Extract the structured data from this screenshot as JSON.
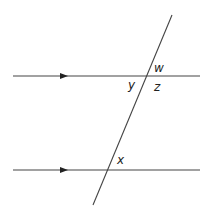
{
  "diagram": {
    "stroke_color": "#444444",
    "lines": {
      "top_parallel": {
        "x1": 13,
        "y1": 76,
        "x2": 200,
        "y2": 76,
        "arrow_x": 65
      },
      "bottom_parallel": {
        "x1": 13,
        "y1": 170,
        "x2": 200,
        "y2": 170,
        "arrow_x": 65
      },
      "transversal": {
        "x1": 172,
        "y1": 15,
        "x2": 93,
        "y2": 205
      }
    },
    "labels": {
      "w": "w",
      "y": "y",
      "z": "z",
      "x": "x"
    }
  }
}
